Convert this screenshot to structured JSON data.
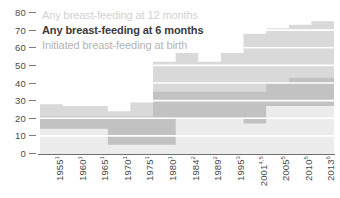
{
  "chart_data": {
    "type": "area",
    "title": "",
    "subtitle": "",
    "xlabel": "",
    "ylabel": "",
    "ylim": [
      0,
      80
    ],
    "yticks": [
      0,
      10,
      20,
      30,
      40,
      50,
      60,
      70,
      80
    ],
    "grid": true,
    "grid_color": "#ffffff",
    "legend_position": "top-left",
    "step_style": "post",
    "categories": [
      "1955",
      "1960",
      "1965",
      "1970",
      "1975",
      "1980",
      "1984",
      "1989",
      "1995",
      "2001",
      "2005",
      "2010",
      "2013"
    ],
    "category_notes": [
      "1",
      "1",
      "1",
      "1",
      "1",
      "1",
      "2",
      "2",
      "3",
      "4,5",
      "5",
      "5",
      "6"
    ],
    "tick_labels": [
      "1955¹",
      "1960¹",
      "1965¹",
      "1970¹",
      "1975¹",
      "1980¹",
      "1984²",
      "1989²",
      "1995³",
      "2001⁴˒⁵",
      "2005⁵",
      "2010⁵",
      "2013⁶"
    ],
    "series": [
      {
        "name": "Initiated breast-feeding at birth",
        "color": "#d9d9d9",
        "values": [
          28,
          27,
          27,
          24,
          29,
          52,
          57,
          52,
          57,
          68,
          71,
          73,
          75
        ]
      },
      {
        "name": "Any breast-feeding at 6 months",
        "color": "#c2c2c2",
        "values": [
          21,
          21,
          21,
          21,
          21,
          35,
          35,
          35,
          35,
          35,
          40,
          43,
          43
        ]
      },
      {
        "name": "Any breast-feeding at 12 months",
        "color": "#ececec",
        "values": [
          14,
          14,
          14,
          5,
          5,
          5,
          20,
          20,
          20,
          17,
          27,
          27,
          27
        ]
      }
    ]
  },
  "y_axis": {
    "ticks": [
      "80",
      "70",
      "60",
      "50",
      "40",
      "30",
      "20",
      "10",
      "0"
    ]
  },
  "x_axis": {
    "labels": [
      {
        "year": "1955",
        "note": "1"
      },
      {
        "year": "1960",
        "note": "1"
      },
      {
        "year": "1965",
        "note": "1"
      },
      {
        "year": "1970",
        "note": "1"
      },
      {
        "year": "1975",
        "note": "1"
      },
      {
        "year": "1980",
        "note": "1"
      },
      {
        "year": "1984",
        "note": "2"
      },
      {
        "year": "1989",
        "note": "2"
      },
      {
        "year": "1995",
        "note": "3"
      },
      {
        "year": "2001",
        "note": "4,5"
      },
      {
        "year": "2005",
        "note": "5"
      },
      {
        "year": "2010",
        "note": "5"
      },
      {
        "year": "2013",
        "note": "6"
      }
    ]
  },
  "legend": {
    "items": [
      {
        "label": "Any breast-feeding at 12 months",
        "color": "#ececec",
        "dash_color": "#d2d2d2"
      },
      {
        "label": "Any breast-feeding at 6 months",
        "color": "#c2c2c2",
        "dash_color": "#8c8c8c"
      },
      {
        "label": "Initiated breast-feeding at birth",
        "color": "#d9d9d9",
        "dash_color": "#d9d9d9"
      }
    ]
  },
  "colors": {
    "axis": "#6f6f6f",
    "tick_text": "#4a4a4a",
    "gridline": "#ffffff",
    "background": "#ffffff"
  }
}
